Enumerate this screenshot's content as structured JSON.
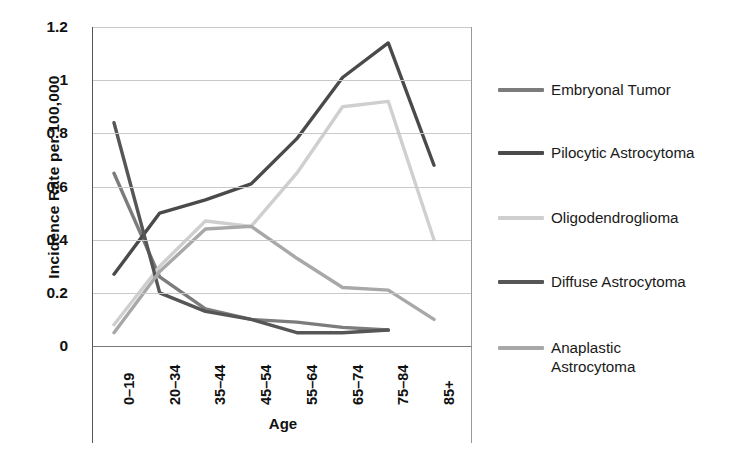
{
  "chart_data": {
    "type": "line",
    "title": "",
    "xlabel": "Age",
    "ylabel": "Incidence Rate per 100,000",
    "categories": [
      "0–19",
      "20–34",
      "35–44",
      "45–54",
      "55–64",
      "65–74",
      "75–84",
      "85+"
    ],
    "ylim": [
      0,
      1.2
    ],
    "yticks": [
      "1.2",
      "1",
      "0.8",
      "0.6",
      "0.4",
      "0.2",
      "0"
    ],
    "ytick_values": [
      1.2,
      1.0,
      0.8,
      0.6,
      0.4,
      0.2,
      0
    ],
    "grid": true,
    "legend_position": "right",
    "series": [
      {
        "name": "Embryonal Tumor",
        "color": "#7c7c7c",
        "values": [
          0.65,
          0.26,
          0.14,
          0.1,
          0.09,
          0.07,
          0.06,
          null
        ]
      },
      {
        "name": "Pilocytic Astrocytoma",
        "color": "#4a4a4a",
        "values": [
          0.27,
          0.5,
          0.55,
          0.61,
          0.78,
          1.01,
          1.14,
          0.68
        ]
      },
      {
        "name": "Oligodendroglioma",
        "color": "#cfcfcf",
        "values": [
          0.08,
          0.3,
          0.47,
          0.45,
          0.65,
          0.9,
          0.92,
          0.4
        ]
      },
      {
        "name": "Diffuse Astrocytoma",
        "color": "#565656",
        "values": [
          0.84,
          0.2,
          0.13,
          0.1,
          0.05,
          0.05,
          0.06,
          null
        ]
      },
      {
        "name": "Anaplastic Astrocytoma",
        "color": "#a8a8a8",
        "values": [
          0.05,
          0.28,
          0.44,
          0.45,
          0.33,
          0.22,
          0.21,
          0.1
        ]
      }
    ]
  },
  "legend": {
    "items": [
      {
        "label": "Embryonal Tumor",
        "color": "#7c7c7c"
      },
      {
        "label": "Pilocytic Astrocytoma",
        "color": "#4a4a4a"
      },
      {
        "label": "Oligodendroglioma",
        "color": "#cfcfcf"
      },
      {
        "label": "Diffuse Astrocytoma",
        "color": "#565656"
      },
      {
        "label": "Anaplastic Astrocytoma",
        "color": "#a8a8a8"
      }
    ]
  }
}
